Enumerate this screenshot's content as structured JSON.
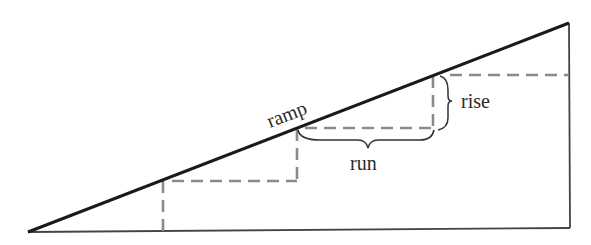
{
  "diagram": {
    "type": "ramp-rise-run",
    "labels": {
      "ramp": "ramp",
      "rise": "rise",
      "run": "run"
    },
    "colors": {
      "ramp_line": "#1a1a1a",
      "frame_line": "#444444",
      "dashed_steps": "#8a8a8a",
      "brace": "#333333",
      "text": "#2a2a2a",
      "background": "#ffffff"
    }
  }
}
